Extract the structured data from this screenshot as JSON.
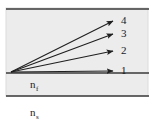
{
  "figure": {
    "type": "optical-waveguide-ray-diagram",
    "background_color": "#ffffff",
    "panel_color": "#ececec",
    "line_color": "#3a3a3a",
    "ray_color": "#1f1f1f",
    "panel": {
      "x": 6,
      "y": 8,
      "width": 142,
      "height": 88
    },
    "boundaries": [
      {
        "name": "cover-film-interface",
        "y": 9
      },
      {
        "name": "film-substrate-interface",
        "y": 73
      },
      {
        "name": "substrate-lower-boundary",
        "y": 96
      }
    ],
    "ray_origin": {
      "x": 11,
      "y": 72
    },
    "rays": [
      {
        "label": "1",
        "tip_x": 113,
        "tip_y": 71,
        "label_x": 121,
        "label_y": 71
      },
      {
        "label": "2",
        "tip_x": 113,
        "tip_y": 51,
        "label_x": 121,
        "label_y": 51
      },
      {
        "label": "3",
        "tip_x": 113,
        "tip_y": 34,
        "label_x": 121,
        "label_y": 34
      },
      {
        "label": "4",
        "tip_x": 113,
        "tip_y": 21,
        "label_x": 121,
        "label_y": 21
      }
    ],
    "index_labels": [
      {
        "name": "film-index",
        "base": "n",
        "subscript": "f",
        "x": 30,
        "y": 88
      },
      {
        "name": "substrate-index",
        "base": "n",
        "subscript": "s",
        "x": 30,
        "y": 116
      }
    ]
  }
}
